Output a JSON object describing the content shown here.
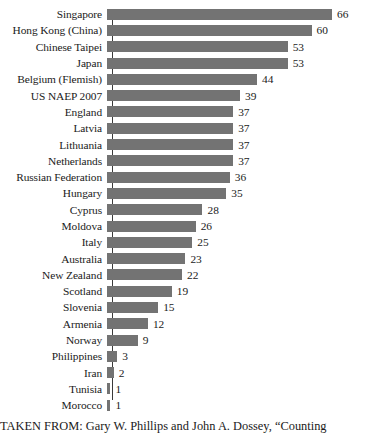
{
  "chart_data": {
    "type": "bar",
    "orientation": "horizontal",
    "title": "",
    "xlabel": "",
    "ylabel": "",
    "grid": false,
    "legend": null,
    "xlim": [
      0,
      66
    ],
    "bar_color": "#737373",
    "axis_color": "#3a3a3a",
    "background": "#ffffff",
    "categories": [
      "Singapore",
      "Hong Kong (China)",
      "Chinese Taipei",
      "Japan",
      "Belgium (Flemish)",
      "US NAEP 2007",
      "England",
      "Latvia",
      "Lithuania",
      "Netherlands",
      "Russian Federation",
      "Hungary",
      "Cyprus",
      "Moldova",
      "Italy",
      "Australia",
      "New Zealand",
      "Scotland",
      "Slovenia",
      "Armenia",
      "Norway",
      "Philippines",
      "Iran",
      "Tunisia",
      "Morocco"
    ],
    "values": [
      66,
      60,
      53,
      53,
      44,
      39,
      37,
      37,
      37,
      37,
      36,
      35,
      28,
      26,
      25,
      23,
      22,
      19,
      15,
      12,
      9,
      3,
      2,
      1,
      1
    ]
  },
  "caption": {
    "text": "TAKEN FROM: Gary W. Phillips and John A. Dossey, “Counting"
  }
}
